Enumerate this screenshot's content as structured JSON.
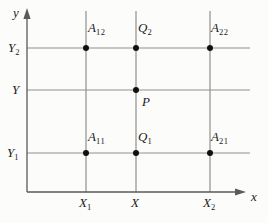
{
  "labels": {
    "y_axis": "y",
    "x_axis": "x",
    "A12": {
      "base": "A",
      "sub": "12"
    },
    "Q2": {
      "base": "Q",
      "sub": "2"
    },
    "A22": {
      "base": "A",
      "sub": "22"
    },
    "Y2": {
      "base": "Y",
      "sub": "2"
    },
    "Y": {
      "base": "Y",
      "sub": ""
    },
    "P": {
      "base": "P",
      "sub": ""
    },
    "A11": {
      "base": "A",
      "sub": "11"
    },
    "Q1": {
      "base": "Q",
      "sub": "1"
    },
    "A21": {
      "base": "A",
      "sub": "21"
    },
    "Y1": {
      "base": "Y",
      "sub": "1"
    },
    "X1": {
      "base": "X",
      "sub": "1"
    },
    "X": {
      "base": "X",
      "sub": ""
    },
    "X2": {
      "base": "X",
      "sub": "2"
    }
  },
  "points": [
    {
      "label": "A12",
      "column": "X1",
      "row": "Y2"
    },
    {
      "label": "Q2",
      "column": "X",
      "row": "Y2"
    },
    {
      "label": "A22",
      "column": "X2",
      "row": "Y2"
    },
    {
      "label": "P",
      "column": "X",
      "row": "Y"
    },
    {
      "label": "A11",
      "column": "X1",
      "row": "Y1"
    },
    {
      "label": "Q1",
      "column": "X",
      "row": "Y1"
    },
    {
      "label": "A21",
      "column": "X2",
      "row": "Y1"
    }
  ],
  "colors": {
    "grid_line": "#8f8f8f",
    "axis": "#5a5a5a",
    "point": "#101010",
    "label": "#1a1a1a",
    "background": "#fcfcfb"
  }
}
